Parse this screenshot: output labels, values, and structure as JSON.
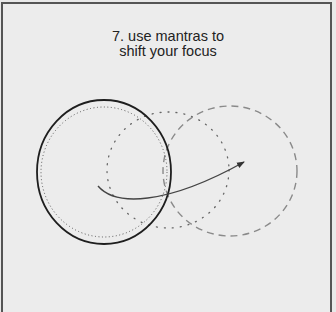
{
  "figure": {
    "title_lines": [
      "7. use mantras to",
      "shift your focus"
    ],
    "colors": {
      "background": "#ececec",
      "border": "#555555",
      "solid_circle": "#222222",
      "dotted_circle": "#555555",
      "dashed_circle": "#888888",
      "arrow": "#444444",
      "text": "#222222"
    },
    "shapes": [
      {
        "name": "current-focus-circle",
        "style": "solid",
        "cx": 104,
        "cy": 172,
        "rx": 67,
        "ry": 72
      },
      {
        "name": "inner-dotted-circle",
        "style": "dotted",
        "cx": 104,
        "cy": 172,
        "rx": 62,
        "ry": 65
      },
      {
        "name": "transition-dotted-circle",
        "style": "sparse-dotted",
        "cx": 168,
        "cy": 170,
        "rx": 61,
        "ry": 58
      },
      {
        "name": "new-focus-dashed-circle",
        "style": "dashed",
        "cx": 230,
        "cy": 171,
        "rx": 67,
        "ry": 65
      }
    ],
    "arrow": {
      "from": [
        98,
        186
      ],
      "to": [
        244,
        162
      ]
    }
  }
}
